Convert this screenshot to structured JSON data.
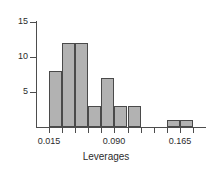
{
  "chart_data": {
    "type": "bar",
    "title": "",
    "xlabel": "Leverages",
    "ylabel": "",
    "grid": false,
    "legend": null,
    "xlim": [
      0.0,
      0.195
    ],
    "ylim": [
      0,
      16
    ],
    "bin_width": 0.015,
    "x_tick_values": [
      0.015,
      0.09,
      0.165
    ],
    "x_tick_labels": [
      "0.015",
      "0.090",
      "0.165"
    ],
    "y_tick_values": [
      5,
      10,
      15
    ],
    "y_tick_labels": [
      "5",
      "10",
      "15"
    ],
    "bins": [
      {
        "left": 0.015,
        "right": 0.03,
        "count": 8
      },
      {
        "left": 0.03,
        "right": 0.045,
        "count": 12
      },
      {
        "left": 0.045,
        "right": 0.06,
        "count": 12
      },
      {
        "left": 0.06,
        "right": 0.075,
        "count": 3
      },
      {
        "left": 0.075,
        "right": 0.09,
        "count": 7
      },
      {
        "left": 0.09,
        "right": 0.105,
        "count": 3
      },
      {
        "left": 0.105,
        "right": 0.12,
        "count": 3
      },
      {
        "left": 0.15,
        "right": 0.165,
        "count": 1
      },
      {
        "left": 0.165,
        "right": 0.18,
        "count": 1
      }
    ],
    "categories": [
      "0.015-0.030",
      "0.030-0.045",
      "0.045-0.060",
      "0.060-0.075",
      "0.075-0.090",
      "0.090-0.105",
      "0.105-0.120",
      "0.150-0.165",
      "0.165-0.180"
    ],
    "values": [
      8,
      12,
      12,
      3,
      7,
      3,
      3,
      1,
      1
    ],
    "colors": {
      "bar_fill": "#b2b2b2",
      "bar_edge": "#4a4a4a",
      "axis": "#4d4d4d",
      "text": "#2b2b2b",
      "background": "#ffffff"
    }
  }
}
